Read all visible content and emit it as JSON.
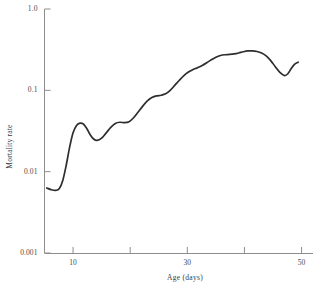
{
  "chart_data": {
    "type": "line",
    "title": "",
    "xlabel": "Age (days)",
    "ylabel": "Mortality rate",
    "xscale": "linear",
    "yscale": "log",
    "xlim": [
      5,
      52
    ],
    "ylim": [
      0.001,
      1.0
    ],
    "grid": false,
    "legend": null,
    "xticks": [
      10,
      20,
      30,
      40,
      50
    ],
    "xticklabels": [
      "10",
      "",
      "30",
      "",
      "50"
    ],
    "yticks": [
      0.001,
      0.01,
      0.1,
      1.0
    ],
    "yticklabels": [
      "0.001",
      "0.01",
      "0.1",
      "1.0"
    ],
    "series": [
      {
        "name": "Mortality rate",
        "color": "#2e2e2e",
        "linewidth": 1.7,
        "x": [
          5.4,
          6.2,
          7.0,
          7.6,
          8.2,
          8.8,
          9.4,
          10.0,
          10.6,
          11.2,
          11.8,
          12.4,
          13.0,
          13.6,
          14.2,
          15.0,
          15.8,
          16.6,
          17.4,
          18.2,
          19.0,
          19.8,
          20.6,
          21.4,
          22.2,
          23.0,
          23.8,
          24.6,
          25.4,
          26.2,
          27.0,
          27.8,
          28.6,
          29.4,
          30.2,
          31.0,
          31.8,
          32.6,
          33.4,
          34.2,
          35.0,
          35.8,
          36.6,
          37.4,
          38.2,
          39.0,
          39.8,
          40.6,
          41.4,
          42.2,
          43.0,
          43.8,
          44.6,
          45.4,
          46.2,
          47.0,
          47.6,
          48.2,
          48.8,
          49.4
        ],
        "y": [
          0.0063,
          0.006,
          0.0059,
          0.0062,
          0.0078,
          0.012,
          0.02,
          0.03,
          0.037,
          0.0395,
          0.0385,
          0.034,
          0.0285,
          0.0252,
          0.0242,
          0.0258,
          0.03,
          0.035,
          0.0392,
          0.0405,
          0.04,
          0.0412,
          0.046,
          0.054,
          0.064,
          0.074,
          0.0815,
          0.0855,
          0.087,
          0.0905,
          0.1,
          0.115,
          0.133,
          0.152,
          0.168,
          0.18,
          0.19,
          0.202,
          0.218,
          0.237,
          0.255,
          0.268,
          0.274,
          0.276,
          0.28,
          0.288,
          0.298,
          0.305,
          0.306,
          0.3,
          0.287,
          0.265,
          0.232,
          0.195,
          0.166,
          0.152,
          0.16,
          0.185,
          0.21,
          0.222
        ]
      }
    ]
  },
  "axes": {
    "y_title": "Mortality rate",
    "x_title": "Age (days)",
    "y_tick_labels": [
      {
        "text": "1.0",
        "value": 1.0
      },
      {
        "text": "0.1",
        "value": 0.1
      },
      {
        "text": "0.01",
        "value": 0.01
      },
      {
        "text": "0.001",
        "value": 0.001
      }
    ],
    "x_tick_labels": [
      {
        "text": "10",
        "value": 10
      },
      {
        "text": "30",
        "value": 30
      },
      {
        "text": "50",
        "value": 50
      }
    ]
  },
  "style": {
    "axis_color": "#8d8d8d",
    "curve_color": "#2e2e2e",
    "text_color": "#3a3a3a",
    "background": "#ffffff"
  }
}
